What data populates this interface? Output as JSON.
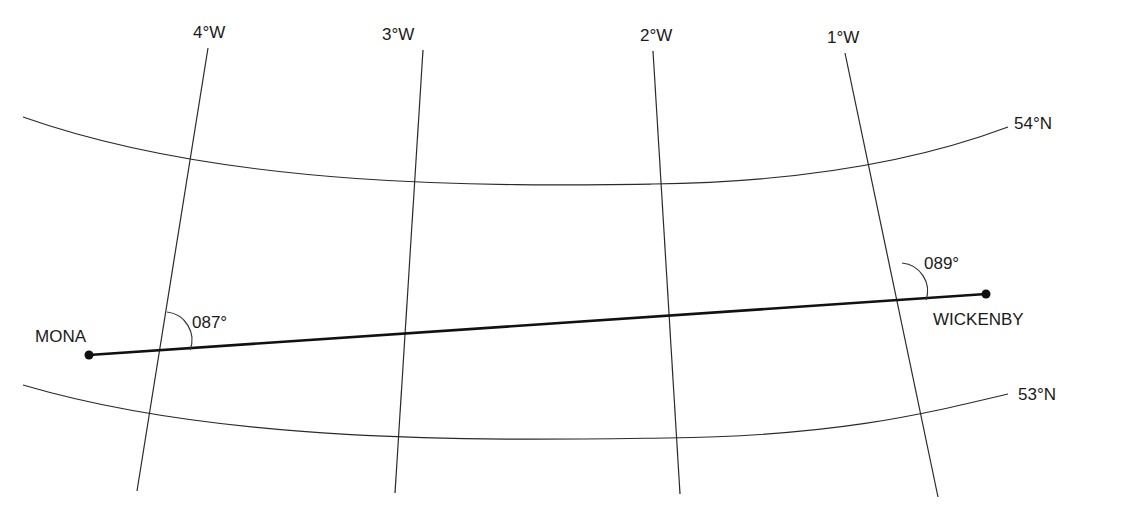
{
  "diagram": {
    "type": "navigation chart - great circle track between two points",
    "meridians": [
      {
        "label": "4°W",
        "x1": 208,
        "y1": 48,
        "x2": 137,
        "y2": 491,
        "label_x": 193,
        "label_y": 38
      },
      {
        "label": "3°W",
        "x1": 423,
        "y1": 50,
        "x2": 395,
        "y2": 493,
        "label_x": 382,
        "label_y": 40
      },
      {
        "label": "2°W",
        "x1": 653,
        "y1": 51,
        "x2": 680,
        "y2": 494,
        "label_x": 640,
        "label_y": 41
      },
      {
        "label": "1°W",
        "x1": 845,
        "y1": 53,
        "x2": 938,
        "y2": 497,
        "label_x": 827,
        "label_y": 43
      }
    ],
    "parallels": [
      {
        "label": "54°N",
        "path": "M 23 117 C 230 190, 500 186, 653 184 S 920 160, 1008 127",
        "label_x": 1014,
        "label_y": 129
      },
      {
        "label": "53°N",
        "path": "M 23 385 C 230 446, 500 440, 667 438 S 920 415, 1008 394",
        "label_x": 1018,
        "label_y": 400
      }
    ],
    "points": [
      {
        "name": "MONA",
        "x": 89,
        "y": 355,
        "label_x": 35,
        "label_y": 342
      },
      {
        "name": "WICKENBY",
        "x": 986,
        "y": 294,
        "label_x": 933,
        "label_y": 325
      }
    ],
    "angles": [
      {
        "label": "087°",
        "arc": "M 167 312 A 28 28 0 0 1 190 350",
        "label_x": 192,
        "label_y": 328
      },
      {
        "label": "089°",
        "arc": "M 902 263 A 28 28 0 0 1 926 300",
        "label_x": 924,
        "label_y": 269
      }
    ]
  }
}
